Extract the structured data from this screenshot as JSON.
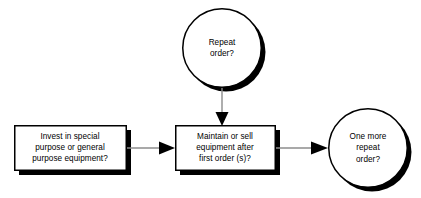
{
  "diagram": {
    "type": "flowchart",
    "background_color": "#ffffff",
    "shape_fill": "#ffffff",
    "shape_border_color": "#000000",
    "shadow_color": "#000000",
    "connector_color": "#8c8c8c",
    "arrowhead_color": "#000000",
    "text_color": "#000000",
    "nodes": [
      {
        "id": "invest-equipment",
        "shape": "rectangle",
        "label": "Invest in special\npurpose or general\npurpose equipment?",
        "lines": [
          "Invest in special",
          "purpose or general",
          "purpose equipment?"
        ]
      },
      {
        "id": "repeat-order",
        "shape": "circle",
        "label": "Repeat\norder?",
        "lines": [
          "Repeat",
          "order?"
        ]
      },
      {
        "id": "maintain-or-sell",
        "shape": "rectangle",
        "label": "Maintain or sell\nequipment after\nfirst order (s)?",
        "lines": [
          "Maintain or sell",
          "equipment after",
          "first order (s)?"
        ]
      },
      {
        "id": "one-more-repeat-order",
        "shape": "circle",
        "label": "One more\nrepeat\norder?",
        "lines": [
          "One more",
          "repeat",
          "order?"
        ]
      }
    ],
    "connectors": [
      {
        "id": "invest-to-maintain",
        "from": "invest-equipment",
        "to": "maintain-or-sell",
        "direction": "right",
        "label": ""
      },
      {
        "id": "repeat-to-maintain",
        "from": "repeat-order",
        "to": "maintain-or-sell",
        "direction": "down",
        "label": ""
      },
      {
        "id": "maintain-to-onemore",
        "from": "maintain-or-sell",
        "to": "one-more-repeat-order",
        "direction": "right",
        "label": ""
      }
    ]
  }
}
